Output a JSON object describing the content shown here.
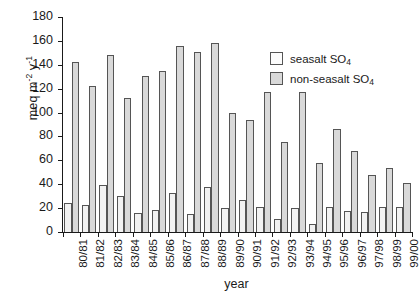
{
  "chart_data": {
    "type": "bar",
    "title": "",
    "xlabel": "year",
    "ylabel": "meq m-2 y-1",
    "ylabel_parts": {
      "prefix": "meq m",
      "sup1": "-2",
      "mid": " y",
      "sup2": "-1"
    },
    "ylim": [
      0,
      180
    ],
    "yticks": [
      0,
      20,
      40,
      60,
      80,
      100,
      120,
      140,
      160,
      180
    ],
    "grid": false,
    "legend_position": "upper-right",
    "categories": [
      "80/81",
      "81/82",
      "82/83",
      "83/84",
      "84/85",
      "85/86",
      "86/87",
      "87/88",
      "88/89",
      "89/90",
      "90/91",
      "91/92",
      "92/93",
      "93/94",
      "94/95",
      "95/96",
      "96/97",
      "97/98",
      "98/99",
      "99/00"
    ],
    "series": [
      {
        "name": "seasalt SO4",
        "name_parts": {
          "text": "seasalt SO",
          "sub": "4"
        },
        "color": "#f2f2f2",
        "values": [
          24,
          23,
          39,
          30,
          16,
          18.5,
          33,
          15,
          38,
          20,
          27,
          21,
          11,
          20.5,
          7,
          21,
          18,
          17,
          21,
          21
        ]
      },
      {
        "name": "non-seasalt SO4",
        "name_parts": {
          "text": "non-seasalt SO",
          "sub": "4"
        },
        "color": "#d9d9d9",
        "values": [
          142,
          122,
          148,
          112,
          131,
          135,
          156,
          151,
          158,
          100,
          94,
          117,
          75,
          117,
          58,
          86,
          68,
          48,
          54,
          41
        ]
      }
    ]
  }
}
